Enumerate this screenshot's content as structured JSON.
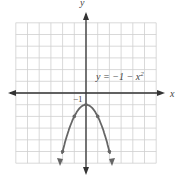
{
  "chart_data": {
    "type": "line",
    "title": "",
    "equation_label": "y = −1 − x²",
    "xlabel": "x",
    "ylabel": "y",
    "xlim": [
      -6,
      6
    ],
    "ylim": [
      -6,
      6
    ],
    "grid": true,
    "series": [
      {
        "name": "y = −1 − x²",
        "points": [
          [
            -2,
            -5
          ],
          [
            -1,
            -2
          ],
          [
            0,
            -1
          ],
          [
            1,
            -2
          ],
          [
            2,
            -5
          ]
        ]
      }
    ],
    "annotations": [
      {
        "text": "−1",
        "x": 0,
        "y": -1
      }
    ],
    "colors": {
      "curve": "#666666",
      "grid": "#cccccc",
      "axes": "#333333"
    }
  },
  "labels": {
    "x_axis": "x",
    "y_axis": "y",
    "equation_prefix": "y = −1 − x",
    "equation_exp": "2",
    "vertex_label": "−1"
  }
}
